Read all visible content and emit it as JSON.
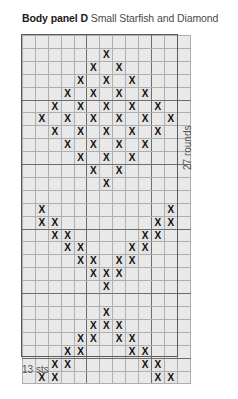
{
  "title": {
    "panel": "Body panel D",
    "motif": "Small Starfish and Diamond"
  },
  "labels": {
    "rounds": "27 rounds",
    "stitches": "13 sts"
  },
  "colors": {
    "grid_fill": "#e9e9e9",
    "grid_line_minor": "#aeaeae",
    "grid_line_major": "#6d6d6d",
    "frame": "#5a5a5a",
    "mark": "#111111",
    "title_bold": "#1a1a1a",
    "title_regular": "#4a4a4a",
    "label": "#555555"
  },
  "chart_data": {
    "type": "grid",
    "columns": 13,
    "rows": 27,
    "xlabel": "13 sts",
    "ylabel": "27 rounds",
    "symbol": "X",
    "symbol_meaning": "contrast-colour stitch",
    "grid": true,
    "major_gridline_every": 5,
    "motifs": [
      "Small Starfish",
      "Diamond"
    ],
    "filled_cells_by_row": [
      [],
      [
        7
      ],
      [
        6,
        8
      ],
      [
        5,
        7,
        9
      ],
      [
        4,
        6,
        8,
        10
      ],
      [
        3,
        5,
        7,
        9,
        11
      ],
      [
        2,
        4,
        6,
        8,
        10,
        12
      ],
      [
        3,
        5,
        7,
        9,
        11
      ],
      [
        4,
        6,
        8,
        10
      ],
      [
        5,
        7,
        9
      ],
      [
        6,
        8
      ],
      [
        7
      ],
      [],
      [
        2,
        12
      ],
      [
        2,
        3,
        11,
        12
      ],
      [
        3,
        4,
        10,
        11
      ],
      [
        4,
        5,
        9,
        10
      ],
      [
        5,
        6,
        8,
        9
      ],
      [
        6,
        7,
        8
      ],
      [
        7
      ],
      [],
      [
        7
      ],
      [
        6,
        7,
        8
      ],
      [
        5,
        6,
        8,
        9
      ],
      [
        4,
        5,
        9,
        10
      ],
      [
        3,
        4,
        10,
        11
      ],
      [
        2,
        3,
        11,
        12
      ],
      [
        2,
        12
      ]
    ]
  }
}
